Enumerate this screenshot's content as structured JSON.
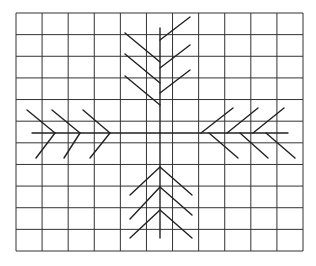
{
  "diagram": {
    "type": "grid-figure",
    "grid": {
      "columns": 11,
      "rows": 11,
      "x0": 16,
      "y0": 13,
      "x1": 303,
      "y1": 251,
      "line_color": "#333333"
    },
    "figure": {
      "description": "Four arrow/feather shapes arranged in a cross on a grid, with branches pointing toward the center",
      "line_color": "#222222",
      "center": [
        160,
        133
      ],
      "arms": [
        {
          "name": "top",
          "stem": [
            [
              160,
              28
            ],
            [
              160,
              133
            ]
          ],
          "branches": [
            [
              [
                125,
                33
              ],
              [
                160,
                62
              ]
            ],
            [
              [
                190,
                17
              ],
              [
                160,
                40
              ]
            ],
            [
              [
                125,
                54
              ],
              [
                160,
                83
              ]
            ],
            [
              [
                190,
                45
              ],
              [
                160,
                68
              ]
            ],
            [
              [
                125,
                76
              ],
              [
                160,
                105
              ]
            ],
            [
              [
                190,
                70
              ],
              [
                160,
                93
              ]
            ]
          ]
        },
        {
          "name": "bottom",
          "stem": [
            [
              160,
              133
            ],
            [
              160,
              238
            ]
          ],
          "branches": [
            [
              [
                160,
                167
              ],
              [
                130,
                195
              ]
            ],
            [
              [
                160,
                167
              ],
              [
                192,
                195
              ]
            ],
            [
              [
                160,
                187
              ],
              [
                130,
                219
              ]
            ],
            [
              [
                160,
                187
              ],
              [
                192,
                215
              ]
            ],
            [
              [
                160,
                210
              ],
              [
                130,
                238
              ]
            ],
            [
              [
                160,
                210
              ],
              [
                192,
                238
              ]
            ]
          ]
        },
        {
          "name": "left",
          "stem": [
            [
              32,
              133
            ],
            [
              160,
              133
            ]
          ],
          "branches": [
            [
              [
                27,
                110
              ],
              [
                55,
                133
              ]
            ],
            [
              [
                52,
                110
              ],
              [
                80,
                133
              ]
            ],
            [
              [
                83,
                110
              ],
              [
                110,
                133
              ]
            ],
            [
              [
                55,
                133
              ],
              [
                36,
                158
              ]
            ],
            [
              [
                80,
                133
              ],
              [
                64,
                158
              ]
            ],
            [
              [
                110,
                133
              ],
              [
                90,
                158
              ]
            ]
          ]
        },
        {
          "name": "right",
          "stem": [
            [
              160,
              133
            ],
            [
              288,
              133
            ]
          ],
          "branches": [
            [
              [
                201,
                133
              ],
              [
                233,
                108
              ]
            ],
            [
              [
                227,
                133
              ],
              [
                258,
                108
              ]
            ],
            [
              [
                253,
                133
              ],
              [
                284,
                108
              ]
            ],
            [
              [
                209,
                133
              ],
              [
                238,
                158
              ]
            ],
            [
              [
                240,
                133
              ],
              [
                268,
                158
              ]
            ],
            [
              [
                266,
                133
              ],
              [
                295,
                158
              ]
            ]
          ]
        }
      ]
    }
  }
}
